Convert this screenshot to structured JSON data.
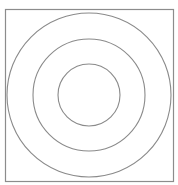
{
  "diagram": {
    "type": "concentric-circles",
    "background": "#ffffff",
    "stroke_color": "#8a8a8a",
    "frame": {
      "x": 5,
      "y": 9,
      "width": 168,
      "height": 172,
      "stroke": "#8c8c8c"
    },
    "center": {
      "x": 89,
      "y": 95
    },
    "circles": [
      {
        "name": "outer-ring",
        "r": 82
      },
      {
        "name": "middle-ring",
        "r": 56
      },
      {
        "name": "inner-ring",
        "r": 31
      }
    ]
  }
}
